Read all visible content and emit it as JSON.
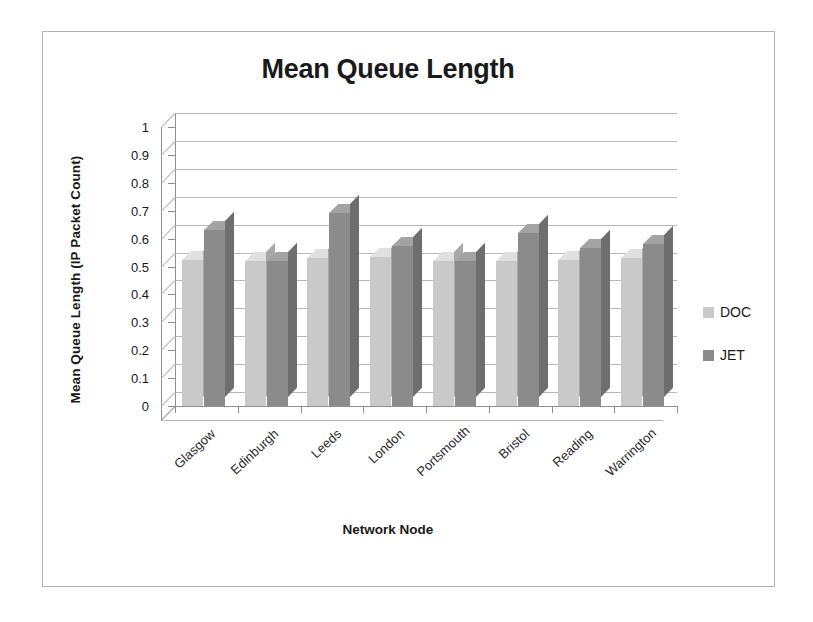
{
  "chart_data": {
    "type": "bar",
    "title": "Mean Queue Length",
    "xlabel": "Network Node",
    "ylabel": "Mean Queue Length (IP Packet Count)",
    "categories": [
      "Glasgow",
      "Edinburgh",
      "Leeds",
      "London",
      "Portsmouth",
      "Bristol",
      "Reading",
      "Warrington"
    ],
    "series": [
      {
        "name": "DOC",
        "color": "#c9c9c9",
        "values": [
          0.525,
          0.52,
          0.53,
          0.535,
          0.52,
          0.52,
          0.525,
          0.53
        ]
      },
      {
        "name": "JET",
        "color": "#8b8b8b",
        "values": [
          0.63,
          0.52,
          0.69,
          0.575,
          0.52,
          0.62,
          0.565,
          0.58
        ]
      }
    ],
    "ylim": [
      0,
      1
    ],
    "ytick_labels": [
      "1",
      "0.9",
      "0.8",
      "0.7",
      "0.6",
      "0.5",
      "0.4",
      "0.3",
      "0.2",
      "0.1",
      "0"
    ],
    "ytick_values": [
      1,
      0.9,
      0.8,
      0.7,
      0.6,
      0.5,
      0.4,
      0.3,
      0.2,
      0.1,
      0
    ],
    "grid": true,
    "legend_position": "right",
    "style": "3d-column"
  },
  "legend": {
    "items": [
      {
        "label": "DOC",
        "color": "#c9c9c9"
      },
      {
        "label": "JET",
        "color": "#8b8b8b"
      }
    ]
  }
}
